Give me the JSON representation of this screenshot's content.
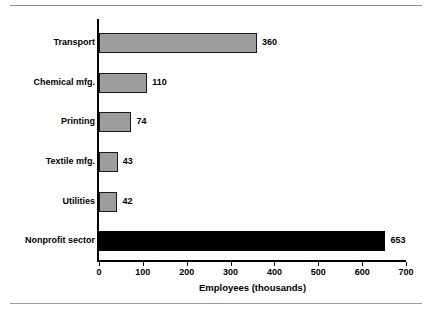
{
  "chart_data": {
    "type": "bar",
    "orientation": "horizontal",
    "title": "",
    "xlabel": "Employees (thousands)",
    "ylabel": "",
    "xlim": [
      0,
      700
    ],
    "xticks": [
      0,
      100,
      200,
      300,
      400,
      500,
      600,
      700
    ],
    "grid": false,
    "legend": null,
    "categories": [
      "Transport",
      "Chemical mfg.",
      "Printing",
      "Textile mfg.",
      "Utilities",
      "Nonprofit sector"
    ],
    "values": [
      360,
      110,
      74,
      43,
      42,
      653
    ],
    "data_labels": [
      "360",
      "110",
      "74",
      "43",
      "42",
      "653"
    ],
    "bar_colors": [
      "#9d9d9d",
      "#9d9d9d",
      "#9d9d9d",
      "#9d9d9d",
      "#9d9d9d",
      "#000000"
    ],
    "tick_labels": [
      "0",
      "100",
      "200",
      "300",
      "400",
      "500",
      "600",
      "700"
    ]
  }
}
